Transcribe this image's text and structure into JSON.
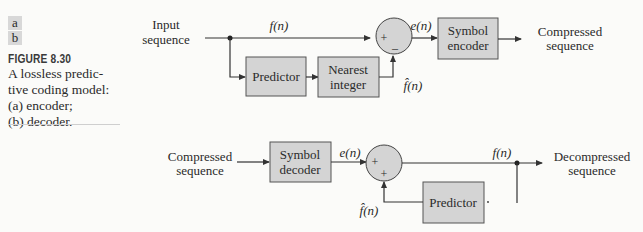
{
  "caption": {
    "panel_a": "a",
    "panel_b": "b",
    "figure_number": "FIGURE 8.30",
    "lines": [
      "A lossless predic-",
      "tive coding model:",
      "(a) encoder;",
      "(b) decoder."
    ]
  },
  "encoder": {
    "input_label_1": "Input",
    "input_label_2": "sequence",
    "signal_f": "f(n)",
    "predictor": "Predictor",
    "nearest_1": "Nearest",
    "nearest_2": "integer",
    "sum_plus": "+",
    "sum_minus": "–",
    "signal_e": "e(n)",
    "signal_fhat": "f̂(n)",
    "encoder_1": "Symbol",
    "encoder_2": "encoder",
    "output_1": "Compressed",
    "output_2": "sequence"
  },
  "decoder": {
    "input_1": "Compressed",
    "input_2": "sequence",
    "decoder_1": "Symbol",
    "decoder_2": "decoder",
    "signal_e": "e(n)",
    "sum_plus1": "+",
    "sum_plus2": "+",
    "signal_f": "f(n)",
    "signal_fhat": "f̂(n)",
    "predictor": "Predictor",
    "output_1": "Decompressed",
    "output_2": "sequence"
  },
  "colors": {
    "box_fill": "#d4d4d4",
    "line": "#333333",
    "background": "#fbfbf9"
  }
}
